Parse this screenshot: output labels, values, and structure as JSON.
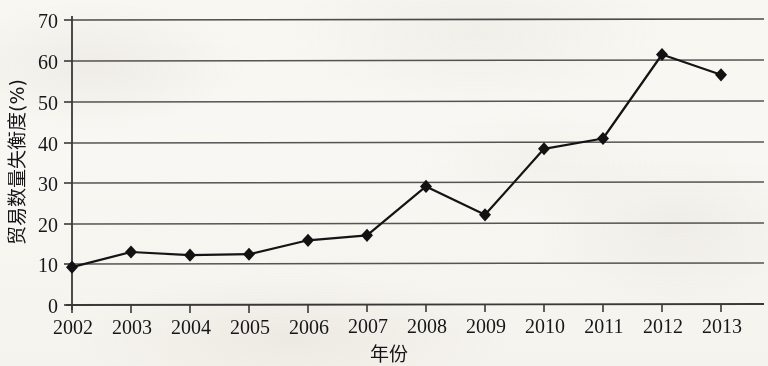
{
  "chart_data": {
    "type": "line",
    "title": "",
    "xlabel": "年份",
    "ylabel": "贸易数量失衡度(%)",
    "categories": [
      "2002",
      "2003",
      "2004",
      "2005",
      "2006",
      "2007",
      "2008",
      "2009",
      "2010",
      "2011",
      "2012",
      "2013"
    ],
    "values": [
      9.3,
      13.0,
      12.2,
      12.4,
      15.8,
      17.0,
      29.0,
      22.0,
      38.2,
      40.7,
      61.3,
      56.3
    ],
    "series": [
      {
        "name": "贸易数量失衡度",
        "values": [
          9.3,
          13.0,
          12.2,
          12.4,
          15.8,
          17.0,
          29.0,
          22.0,
          38.2,
          40.7,
          61.3,
          56.3
        ]
      }
    ],
    "ylim": [
      0,
      70
    ],
    "yticks": [
      "0",
      "10",
      "20",
      "30",
      "40",
      "50",
      "60",
      "70"
    ],
    "ytick_values": [
      0,
      10,
      20,
      30,
      40,
      50,
      60,
      70
    ],
    "xticks": [
      "2002",
      "2003",
      "2004",
      "2005",
      "2006",
      "2007",
      "2008",
      "2009",
      "2010",
      "2011",
      "2012",
      "2013"
    ],
    "grid": "horizontal",
    "legend": "none",
    "marker": "diamond",
    "line_color": "#1a1a1a",
    "grid_color": "#545454",
    "axis_color": "#333333",
    "background_color": "#fbfaf7"
  },
  "axes": {
    "y_title": "贸易数量失衡度(%)",
    "x_title": "年份"
  }
}
